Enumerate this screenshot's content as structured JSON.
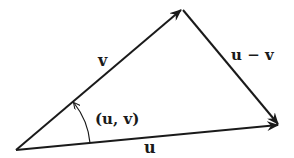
{
  "diagram": {
    "vertices": {
      "origin": [
        16,
        150
      ],
      "v_tip": [
        182,
        9
      ],
      "u_tip": [
        279,
        125
      ]
    },
    "vectors": [
      {
        "name": "v",
        "from": "origin",
        "to": "v_tip",
        "label": "v"
      },
      {
        "name": "u",
        "from": "origin",
        "to": "u_tip",
        "label": "u"
      },
      {
        "name": "u-v",
        "from": "v_tip",
        "to": "u_tip",
        "label": "u − v"
      }
    ],
    "angle": {
      "label": "(u, v)",
      "from_vector": "u",
      "to_vector": "v"
    },
    "colors": {
      "stroke": "#1a1a1a",
      "background": "#ffffff"
    }
  },
  "labels": {
    "v": "v",
    "u": "u",
    "u_minus_v": "u − v",
    "angle": "(u, v)"
  }
}
